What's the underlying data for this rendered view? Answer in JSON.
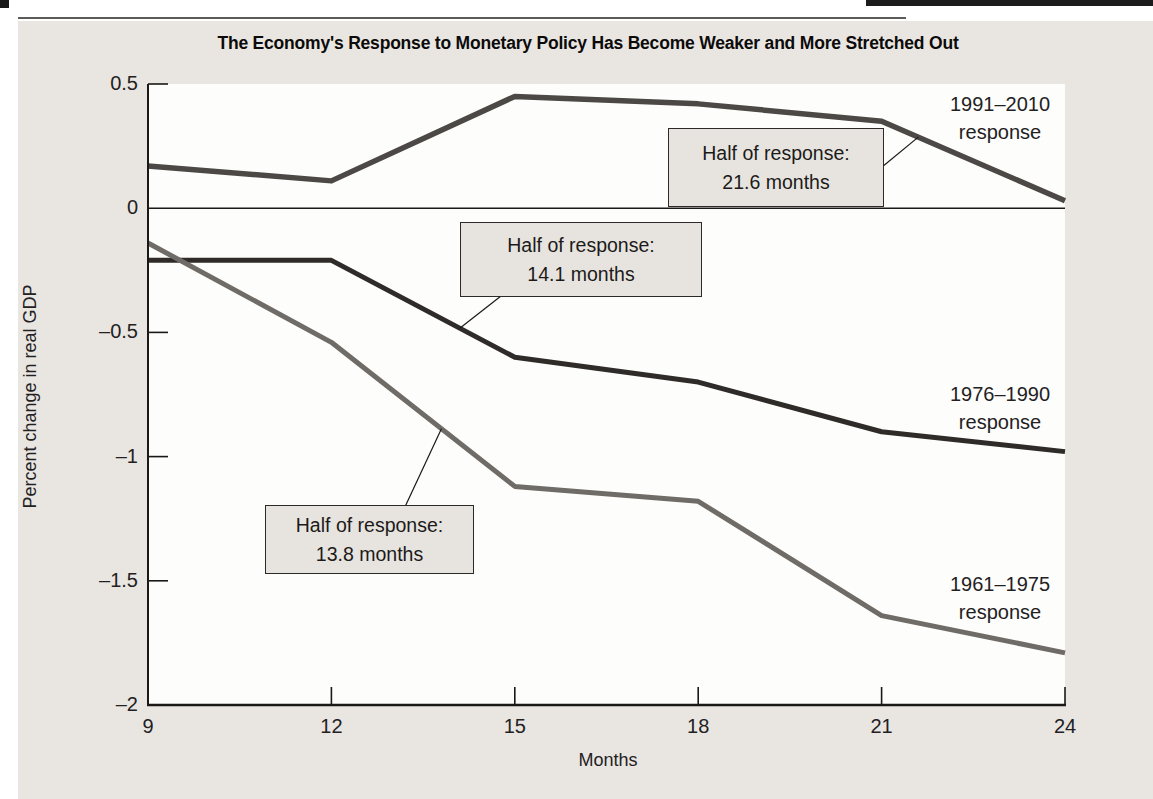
{
  "figure": {
    "panel_background": "#e9e6e2",
    "plot_background": "#fdfdfb",
    "axis_color": "#1a1917",
    "top_rule_color": "#5d5b58"
  },
  "chart_data": {
    "type": "line",
    "title": "The Economy's Response to Monetary Policy Has Become Weaker and More Stretched Out",
    "xlabel": "Months",
    "ylabel": "Percent change in real GDP",
    "x": [
      9,
      12,
      15,
      18,
      21,
      24
    ],
    "x_tick_labels": [
      "9",
      "12",
      "15",
      "18",
      "21",
      "24"
    ],
    "xlim": [
      9,
      24
    ],
    "ylim": [
      -2,
      0.5
    ],
    "y_ticks": [
      0.5,
      0,
      -0.5,
      -1,
      -1.5,
      -2
    ],
    "y_tick_labels": [
      "0.5",
      "0",
      "–0.5",
      "–1",
      "–1.5",
      "–2"
    ],
    "grid": "zero-line-only",
    "legend_position": "inline-labels-right",
    "series": [
      {
        "name": "1991–2010 response",
        "label_lines": [
          "1991–2010",
          "response"
        ],
        "values": [
          0.17,
          0.11,
          0.45,
          0.42,
          0.35,
          0.03
        ],
        "color": "#4b4845",
        "stroke_width": 5.5
      },
      {
        "name": "1976–1990 response",
        "label_lines": [
          "1976–1990",
          "response"
        ],
        "values": [
          -0.21,
          -0.21,
          -0.6,
          -0.7,
          -0.9,
          -0.98
        ],
        "color": "#2e2b29",
        "stroke_width": 5
      },
      {
        "name": "1961–1975 response",
        "label_lines": [
          "1961–1975",
          "response"
        ],
        "values": [
          -0.14,
          -0.54,
          -1.12,
          -1.18,
          -1.64,
          -1.79
        ],
        "color": "#6f6b67",
        "stroke_width": 5
      }
    ],
    "annotations": [
      {
        "lines": [
          "Half of response:",
          "21.6 months"
        ],
        "series_index": 0,
        "anchor_month": 21.6
      },
      {
        "lines": [
          "Half of response:",
          "14.1 months"
        ],
        "series_index": 1,
        "anchor_month": 14.1
      },
      {
        "lines": [
          "Half of response:",
          "13.8 months"
        ],
        "series_index": 2,
        "anchor_month": 13.8
      }
    ]
  }
}
